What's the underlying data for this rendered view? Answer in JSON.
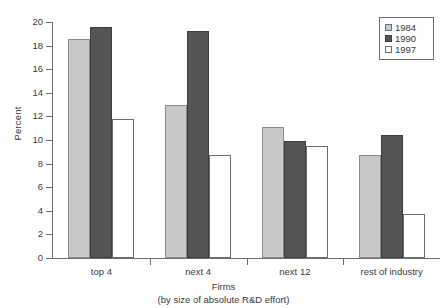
{
  "chart_data": {
    "type": "bar",
    "title": "",
    "xlabel": "Firms",
    "xlabel_sub": "(by size of absolute R&D effort)",
    "ylabel": "Percent",
    "ylim": [
      0,
      20
    ],
    "ytick_step": 2,
    "yticks": [
      "0",
      "2",
      "4",
      "6",
      "8",
      "10",
      "12",
      "14",
      "16",
      "18",
      "20"
    ],
    "grid": false,
    "legend_position": "top-right",
    "categories": [
      "top 4",
      "next 4",
      "next 12",
      "rest of industry"
    ],
    "series": [
      {
        "name": "1984",
        "color": "#c8c8c8",
        "values": [
          18.6,
          13.0,
          11.1,
          8.7
        ]
      },
      {
        "name": "1990",
        "color": "#545454",
        "values": [
          19.6,
          19.2,
          9.9,
          10.4
        ]
      },
      {
        "name": "1997",
        "color": "#ffffff",
        "values": [
          11.8,
          8.7,
          9.5,
          3.7
        ]
      }
    ]
  },
  "legend": {
    "entries": [
      {
        "label": "1984"
      },
      {
        "label": "1990"
      },
      {
        "label": "1997"
      }
    ]
  },
  "colors": {
    "series_1984": "#c8c8c8",
    "series_1990": "#545454",
    "series_1997": "#ffffff",
    "axis": "#6e6e6e",
    "text": "#3a3a3a",
    "background": "#ffffff"
  }
}
